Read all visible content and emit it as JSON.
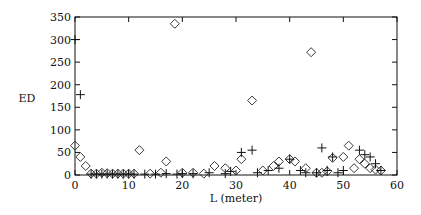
{
  "chart_data": {
    "type": "scatter",
    "title": "",
    "xlabel": "L (meter)",
    "ylabel": "ED",
    "xlim": [
      0,
      60
    ],
    "ylim": [
      0,
      350
    ],
    "x_ticks": [
      0,
      10,
      20,
      30,
      40,
      50,
      60
    ],
    "y_ticks": [
      0,
      50,
      100,
      150,
      200,
      250,
      300,
      350
    ],
    "grid": false,
    "legend": null,
    "series": [
      {
        "name": "diamond",
        "marker": "diamond",
        "points": [
          [
            0,
            65
          ],
          [
            1,
            40
          ],
          [
            2,
            20
          ],
          [
            3,
            3
          ],
          [
            4,
            3
          ],
          [
            5,
            5
          ],
          [
            6,
            4
          ],
          [
            7,
            3
          ],
          [
            8,
            3
          ],
          [
            9,
            3
          ],
          [
            10,
            3
          ],
          [
            11,
            3
          ],
          [
            12,
            55
          ],
          [
            14,
            3
          ],
          [
            16,
            5
          ],
          [
            17,
            30
          ],
          [
            18.6,
            335
          ],
          [
            20,
            5
          ],
          [
            22,
            5
          ],
          [
            24,
            3
          ],
          [
            26,
            20
          ],
          [
            28,
            15
          ],
          [
            30,
            10
          ],
          [
            31,
            35
          ],
          [
            33,
            165
          ],
          [
            35,
            10
          ],
          [
            37,
            20
          ],
          [
            38,
            30
          ],
          [
            40,
            35
          ],
          [
            41,
            30
          ],
          [
            43,
            15
          ],
          [
            44,
            272
          ],
          [
            45,
            5
          ],
          [
            46,
            5
          ],
          [
            47,
            8
          ],
          [
            48,
            38
          ],
          [
            50,
            40
          ],
          [
            51,
            65
          ],
          [
            52,
            15
          ],
          [
            53,
            35
          ],
          [
            54,
            25
          ],
          [
            55,
            15
          ],
          [
            56,
            12
          ],
          [
            57,
            10
          ]
        ]
      },
      {
        "name": "plus",
        "marker": "plus",
        "points": [
          [
            0,
            300
          ],
          [
            1,
            178
          ],
          [
            3,
            2
          ],
          [
            4,
            2
          ],
          [
            5,
            2
          ],
          [
            6,
            2
          ],
          [
            7,
            2
          ],
          [
            8,
            2
          ],
          [
            9,
            2
          ],
          [
            10,
            2
          ],
          [
            11,
            2
          ],
          [
            13,
            2
          ],
          [
            15,
            2
          ],
          [
            17,
            3
          ],
          [
            19,
            2
          ],
          [
            20,
            3
          ],
          [
            22,
            3
          ],
          [
            25,
            5
          ],
          [
            28,
            3
          ],
          [
            29,
            8
          ],
          [
            31,
            50
          ],
          [
            33,
            55
          ],
          [
            34,
            5
          ],
          [
            36,
            10
          ],
          [
            38,
            15
          ],
          [
            40,
            35
          ],
          [
            42,
            10
          ],
          [
            43,
            5
          ],
          [
            45,
            5
          ],
          [
            46,
            60
          ],
          [
            47,
            10
          ],
          [
            48,
            40
          ],
          [
            49,
            5
          ],
          [
            50,
            10
          ],
          [
            53,
            55
          ],
          [
            54,
            45
          ],
          [
            55,
            40
          ],
          [
            56,
            25
          ],
          [
            57,
            10
          ]
        ]
      }
    ]
  }
}
